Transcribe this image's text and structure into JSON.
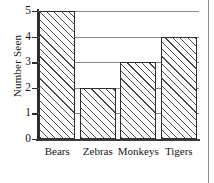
{
  "chart_data": {
    "type": "bar",
    "title": "",
    "subtitle": "",
    "xlabel": "",
    "ylabel": "Number Seen",
    "categories": [
      "Bears",
      "Zebras",
      "Monkeys",
      "Tigers"
    ],
    "values": [
      5,
      2,
      3,
      4
    ],
    "ylim": [
      0,
      5
    ],
    "y_ticks": [
      0,
      1,
      2,
      3,
      4,
      5
    ],
    "y_tick_labels": [
      "0",
      "1",
      "2",
      "3",
      "4",
      "5"
    ],
    "grid": true,
    "grid_axis": "y",
    "legend": false,
    "legend_position": "none",
    "bar_fill": "diagonal-hatch",
    "colors": {
      "axis": "#2b2b2b",
      "grid": "#888888",
      "bar_edge": "#2e2e2e",
      "bar_hatch": "#4a4a4a",
      "background": "#ffffff",
      "text": "#161616"
    }
  },
  "figure": {
    "page_edge_visible": true
  }
}
